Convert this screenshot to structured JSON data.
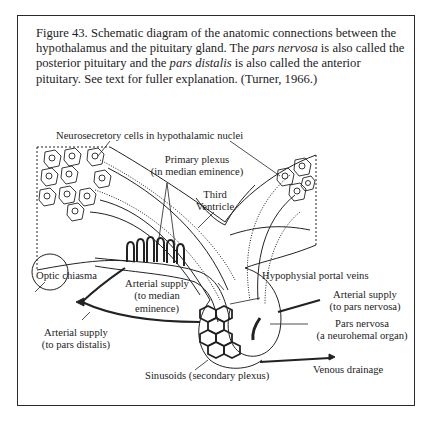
{
  "figure": {
    "number": "Figure 43.",
    "caption_parts": {
      "p1": " Schematic diagram of the anatomic connections between the hypothalamus and the pituitary gland.  The ",
      "i1": "pars nervosa",
      "p2": " is also called the posterior pituitary and the ",
      "i2": "pars distalis",
      "p3": " is also called the anterior pituitary.  See text for fuller explanation.  (Turner, 1966.)"
    }
  },
  "labels": {
    "neurosecretory": "Neurosecretory cells in hypothalamic nuclei",
    "primary_plexus_1": "Primary plexus",
    "primary_plexus_2": "(in median eminence)",
    "third_ventricle_1": "Third",
    "third_ventricle_2": "Ventricle",
    "optic_chiasma": "Optic chiasma",
    "hypophysial_portal_veins": "Hypophysial portal veins",
    "arterial_median_1": "Arterial supply",
    "arterial_median_2": "(to median",
    "arterial_median_3": "eminence)",
    "arterial_nervosa_1": "Arterial supply",
    "arterial_nervosa_2": "(to pars nervosa)",
    "pars_nervosa_1": "Pars nervosa",
    "pars_nervosa_2": "(a neurohemal organ)",
    "arterial_distalis_1": "Arterial supply",
    "arterial_distalis_2": "(to pars distalis)",
    "sinusoids": "Sinusoids (secondary plexus)",
    "venous_drainage": "Venous drainage"
  }
}
